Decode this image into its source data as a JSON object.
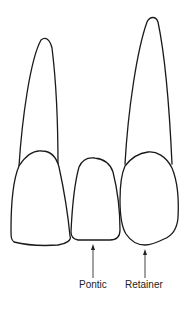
{
  "diagram": {
    "teeth": [
      {
        "id": "left-abutment",
        "has_root": true
      },
      {
        "id": "pontic",
        "has_root": false
      },
      {
        "id": "right-abutment-retainer",
        "has_root": true
      }
    ],
    "labels": {
      "pontic": "Pontic",
      "retainer": "Retainer"
    },
    "colors": {
      "outline": "#1a1a1a",
      "arrow": "#555555",
      "background": "#ffffff"
    }
  }
}
